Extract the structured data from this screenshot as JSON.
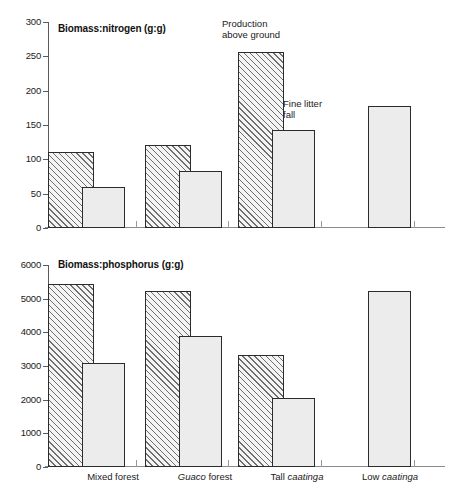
{
  "figure": {
    "panels": [
      {
        "id": "nitrogen",
        "title": "Biomass:nitrogen (g:g)",
        "annotations": [
          {
            "name": "production-above-ground",
            "line1": "Production",
            "line2": "above ground"
          },
          {
            "name": "fine-litter-fall",
            "line1": "Fine litter",
            "line2": "fall"
          }
        ]
      },
      {
        "id": "phosphorus",
        "title": "Biomass:phosphorus (g:g)"
      }
    ],
    "x_categories": [
      {
        "plain": "Mixed forest",
        "pre": "Mixed forest",
        "italic": "",
        "post": ""
      },
      {
        "plain": "Guaco forest",
        "pre": "",
        "italic": "Guaco",
        "post": " forest"
      },
      {
        "plain": "Tall caatinga",
        "pre": "Tall ",
        "italic": "caatinga",
        "post": ""
      },
      {
        "plain": "Low caatinga",
        "pre": "Low ",
        "italic": "caatinga",
        "post": ""
      }
    ],
    "colors": {
      "hatch_line": "#6f6f6f",
      "solid_fill": "#ececec",
      "bar_outline": "#2b2b2b",
      "axis": "#5a5a5a",
      "text": "#1a1a1a",
      "background": "#ffffff"
    }
  },
  "chart_data": [
    {
      "type": "bar",
      "id": "biomass-nitrogen",
      "title": "Biomass:nitrogen (g:g)",
      "xlabel": "",
      "ylabel": "",
      "ylim": [
        0,
        300
      ],
      "yticks": [
        0,
        50,
        100,
        150,
        200,
        250,
        300
      ],
      "ytick_labels": [
        "0",
        "50",
        "100",
        "150",
        "200",
        "250",
        "300"
      ],
      "grid": false,
      "legend": "inline-annotation",
      "categories": [
        "Mixed forest",
        "Guaco forest",
        "Tall caatinga",
        "Low caatinga"
      ],
      "series": [
        {
          "name": "Production above ground",
          "style": "hatched",
          "values": [
            110,
            121,
            256,
            null
          ]
        },
        {
          "name": "Fine litter fall",
          "style": "solid",
          "values": [
            60,
            83,
            143,
            178
          ]
        }
      ]
    },
    {
      "type": "bar",
      "id": "biomass-phosphorus",
      "title": "Biomass:phosphorus (g:g)",
      "xlabel": "",
      "ylabel": "",
      "ylim": [
        0,
        6000
      ],
      "yticks": [
        0,
        1000,
        2000,
        3000,
        4000,
        5000,
        6000
      ],
      "ytick_labels": [
        "0",
        "1000",
        "2000",
        "3000",
        "4000",
        "5000",
        "6000"
      ],
      "grid": false,
      "legend": "none",
      "categories": [
        "Mixed forest",
        "Guaco forest",
        "Tall caatinga",
        "Low caatinga"
      ],
      "series": [
        {
          "name": "Production above ground",
          "style": "hatched",
          "values": [
            5450,
            5220,
            3340,
            null
          ]
        },
        {
          "name": "Fine litter fall",
          "style": "solid",
          "values": [
            3090,
            3890,
            2040,
            5220
          ]
        }
      ]
    }
  ]
}
